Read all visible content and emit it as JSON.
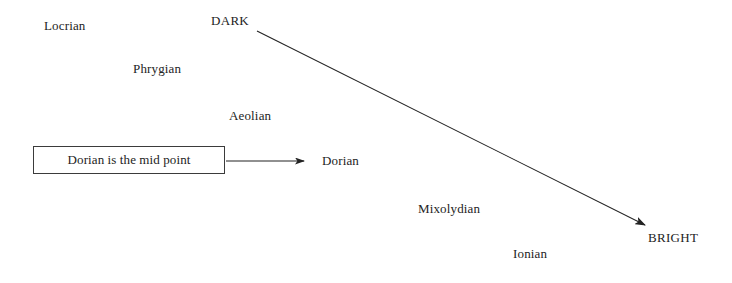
{
  "diagram": {
    "background_color": "#ffffff",
    "line_color": "#232323",
    "text_color": "#232323",
    "poles": {
      "dark_label": "DARK",
      "bright_label": "BRIGHT"
    },
    "modes": [
      {
        "label": "Locrian"
      },
      {
        "label": "Phrygian"
      },
      {
        "label": "Aeolian"
      },
      {
        "label": "Dorian"
      },
      {
        "label": "Mixolydian"
      },
      {
        "label": "Ionian"
      }
    ],
    "callout": {
      "text": "Dorian is the mid point"
    }
  }
}
